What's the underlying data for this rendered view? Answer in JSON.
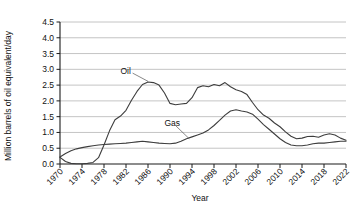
{
  "chart_data": {
    "type": "line",
    "title": "",
    "xlabel": "Year",
    "ylabel": "Million barrels of oil equivalent/day",
    "ylim": [
      0.0,
      4.5
    ],
    "xlim": [
      1970,
      2022
    ],
    "grid": true,
    "legend_position": "inline-annotation",
    "ytick_labels": [
      "0.0",
      "0.5",
      "1.0",
      "1.5",
      "2.0",
      "2.5",
      "3.0",
      "3.5",
      "4.0",
      "4.5"
    ],
    "ytick_values": [
      0.0,
      0.5,
      1.0,
      1.5,
      2.0,
      2.5,
      3.0,
      3.5,
      4.0,
      4.5
    ],
    "xtick_labels": [
      "1970",
      "1974",
      "1978",
      "1982",
      "1986",
      "1990",
      "1994",
      "1998",
      "2002",
      "2006",
      "2010",
      "2014",
      "2018",
      "2022"
    ],
    "xtick_values": [
      1970,
      1974,
      1978,
      1982,
      1986,
      1990,
      1994,
      1998,
      2002,
      2006,
      2010,
      2014,
      2018,
      2022
    ],
    "annotations": [
      {
        "name": "oil-label",
        "text": "Oil",
        "x": 1981,
        "y": 2.95
      },
      {
        "name": "gas-label",
        "text": "Gas",
        "x": 1989,
        "y": 1.3
      }
    ],
    "x": [
      1970,
      1971,
      1972,
      1973,
      1974,
      1975,
      1976,
      1977,
      1978,
      1979,
      1980,
      1981,
      1982,
      1983,
      1984,
      1985,
      1986,
      1987,
      1988,
      1989,
      1990,
      1991,
      1992,
      1993,
      1994,
      1995,
      1996,
      1997,
      1998,
      1999,
      2000,
      2001,
      2002,
      2003,
      2004,
      2005,
      2006,
      2007,
      2008,
      2009,
      2010,
      2011,
      2012,
      2013,
      2014,
      2015,
      2016,
      2017,
      2018,
      2019,
      2020,
      2021,
      2022
    ],
    "series": [
      {
        "name": "Oil",
        "color": "#3d3d3d",
        "values": [
          0.21,
          0.08,
          0.02,
          0.01,
          0.01,
          0.02,
          0.05,
          0.2,
          0.6,
          1.05,
          1.4,
          1.52,
          1.7,
          2.02,
          2.3,
          2.52,
          2.6,
          2.58,
          2.5,
          2.25,
          1.92,
          1.88,
          1.9,
          1.92,
          2.1,
          2.42,
          2.48,
          2.45,
          2.52,
          2.48,
          2.58,
          2.45,
          2.35,
          2.3,
          2.2,
          1.95,
          1.72,
          1.55,
          1.45,
          1.3,
          1.18,
          1.02,
          0.88,
          0.8,
          0.82,
          0.87,
          0.88,
          0.85,
          0.92,
          0.96,
          0.92,
          0.82,
          0.75
        ]
      },
      {
        "name": "Gas",
        "color": "#3d3d3d",
        "values": [
          0.22,
          0.33,
          0.42,
          0.48,
          0.52,
          0.55,
          0.58,
          0.6,
          0.62,
          0.63,
          0.64,
          0.65,
          0.66,
          0.68,
          0.7,
          0.72,
          0.7,
          0.68,
          0.66,
          0.65,
          0.64,
          0.66,
          0.72,
          0.8,
          0.86,
          0.92,
          0.98,
          1.08,
          1.22,
          1.38,
          1.55,
          1.68,
          1.72,
          1.68,
          1.65,
          1.58,
          1.42,
          1.25,
          1.1,
          0.95,
          0.8,
          0.68,
          0.6,
          0.58,
          0.58,
          0.6,
          0.64,
          0.66,
          0.66,
          0.68,
          0.7,
          0.72,
          0.72
        ]
      }
    ]
  }
}
